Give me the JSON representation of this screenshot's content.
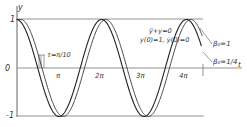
{
  "chart_data": {
    "type": "line",
    "title": "",
    "xlabel": "t",
    "ylabel": "y",
    "x_ticks": [
      "π",
      "2π",
      "3π",
      "4π"
    ],
    "x_tick_values": [
      3.1416,
      6.2832,
      9.4248,
      12.5664
    ],
    "y_ticks": [
      "1",
      "0",
      "-1"
    ],
    "y_tick_values": [
      1,
      0,
      -1
    ],
    "xlim": [
      0,
      14.2
    ],
    "ylim": [
      -1,
      1
    ],
    "grid": false,
    "reference_lines": [
      {
        "y": 1
      },
      {
        "y": -1
      }
    ],
    "annotations": {
      "equation": "ÿ+y=0",
      "initial_conditions": "y(0)=1, ẏ(0)=0",
      "delay": "τ=π/10"
    },
    "series": [
      {
        "name": "β0=1",
        "label": "β0=1",
        "function": "cos(t)",
        "x": [
          0,
          1.5708,
          3.1416,
          4.7124,
          6.2832,
          7.854,
          9.4248,
          10.9956,
          12.5664,
          14.1372
        ],
        "values": [
          1,
          0,
          -1,
          0,
          1,
          0,
          -1,
          0,
          1,
          0
        ]
      },
      {
        "name": "β0=1/4",
        "label": "β0=1/4",
        "function": "cos(t - τ) for t ≥ τ, τ=π/10",
        "x": [
          0,
          0.3142,
          1.885,
          3.4558,
          5.0265,
          6.5973,
          8.1681,
          9.7389,
          11.3097,
          12.8805,
          14.1372
        ],
        "values": [
          1,
          1,
          0,
          -1,
          0,
          1,
          0,
          -1,
          0,
          1,
          0.31
        ]
      }
    ]
  },
  "labels": {
    "y_axis": "y",
    "t_axis": "t",
    "y_one": "1",
    "y_zero": "0",
    "y_minus_one": "-1",
    "tick_pi": "π",
    "tick_2pi": "2π",
    "tick_3pi": "3π",
    "tick_4pi": "4π",
    "tau": "τ=π/10",
    "equation": "ÿ+y=0",
    "initial": "y(0)=1, ẏ(0)=0",
    "beta1": "β₀=1",
    "beta2": "β₀=1/4"
  }
}
